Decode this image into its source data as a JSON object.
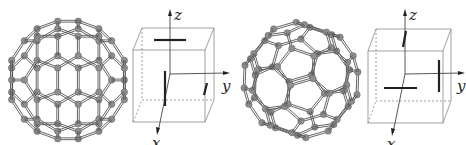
{
  "figure": {
    "panels": [
      {
        "id": "left",
        "molecule": "C60 fullerene (buckyball), pentagon facing viewer",
        "axes": {
          "x": "x",
          "y": "y",
          "z": "z"
        },
        "orientation_marks": [
          "horizontal bar on top face",
          "short slanted mark on right face",
          "vertical bar on front face near x-axis"
        ]
      },
      {
        "id": "right",
        "molecule": "C60 fullerene (buckyball), rotated view",
        "axes": {
          "x": "x",
          "y": "y",
          "z": "z"
        },
        "orientation_marks": [
          "short slanted mark on top face",
          "vertical bar on right face",
          "horizontal bar on front face"
        ]
      }
    ],
    "colors": {
      "atom": "#8f8f8f",
      "bond": "#555555",
      "cube": "#888888",
      "mark": "#222222"
    }
  }
}
